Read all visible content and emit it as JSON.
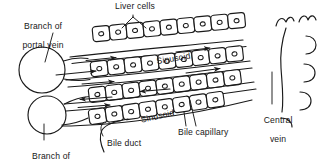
{
  "diagram": {
    "style": {
      "ink": "#1a1a1a",
      "background": "#ffffff",
      "stroke_width": 1.1
    },
    "labels": [
      {
        "id": "liver-cells",
        "text": "Liver cells",
        "lines": [
          "Liver cells"
        ],
        "x": 110,
        "y": 2,
        "align": "center",
        "leader": "two-branch-v"
      },
      {
        "id": "branch-portal-vein",
        "text": "Branch of portal vein",
        "lines": [
          "Branch of",
          "portal vein"
        ],
        "x": 6,
        "y": 12,
        "align": "center",
        "leader": "diagonal-down-right"
      },
      {
        "id": "sinusoid-upper",
        "text": "Sinusoid",
        "lines": [
          "Sinusoid"
        ],
        "x": 156,
        "y": 57,
        "align": "left",
        "rotation": -9,
        "leader": "none"
      },
      {
        "id": "sinusoid-lower",
        "text": "Sinusoid",
        "lines": [
          "Sinusoid"
        ],
        "x": 140,
        "y": 116,
        "align": "left",
        "rotation": -13,
        "leader": "none"
      },
      {
        "id": "central-vein",
        "text": "Central vein",
        "lines": [
          "Central",
          "vein"
        ],
        "x": 272,
        "y": 106,
        "align": "center",
        "leader": "vertical-up"
      },
      {
        "id": "bile-capillary",
        "text": "Bile capillary",
        "lines": [
          "Bile capillary"
        ],
        "x": 178,
        "y": 128,
        "align": "left",
        "leader": "two-vertical-up"
      },
      {
        "id": "bile-duct",
        "text": "Bile duct",
        "lines": [
          "Bile duct"
        ],
        "x": 107,
        "y": 139,
        "align": "left",
        "leader": "curved-up-left"
      },
      {
        "id": "branch-hepatic-artery",
        "text": "Branch of hepatic artery",
        "lines": [
          "Branch of",
          "hepatic artery"
        ],
        "x": 6,
        "y": 142,
        "align": "center",
        "leader": "vertical-up"
      }
    ],
    "structures": [
      {
        "id": "portal-vein-circle",
        "kind": "vessel-lumen",
        "shape": "circle",
        "cx": 42,
        "cy": 70,
        "r": 23
      },
      {
        "id": "hepatic-artery-circle",
        "kind": "vessel-lumen",
        "shape": "circle",
        "cx": 47,
        "cy": 115,
        "r": 19
      },
      {
        "id": "central-vein-outline",
        "kind": "vessel-wall",
        "shape": "scalloped-arc",
        "cx": 296,
        "cy": 72
      },
      {
        "id": "hepatocyte-plate-1",
        "kind": "cell-row",
        "cells": 8
      },
      {
        "id": "hepatocyte-plate-2",
        "kind": "cell-row",
        "cells": 8
      },
      {
        "id": "hepatocyte-plate-3",
        "kind": "cell-row",
        "cells": 8
      },
      {
        "id": "hepatocyte-plate-4",
        "kind": "cell-row",
        "cells": 7
      },
      {
        "id": "sinusoid-channel-1",
        "kind": "sinusoid",
        "flow": "right"
      },
      {
        "id": "sinusoid-channel-2",
        "kind": "sinusoid",
        "flow": "right"
      },
      {
        "id": "sinusoid-channel-3",
        "kind": "sinusoid",
        "flow": "right"
      },
      {
        "id": "bile-duct-tube",
        "kind": "duct",
        "flow": "left"
      }
    ],
    "flow_arrows": [
      {
        "id": "arrow-sinusoid-1a",
        "direction": "right"
      },
      {
        "id": "arrow-sinusoid-1b",
        "direction": "right"
      },
      {
        "id": "arrow-sinusoid-2a",
        "direction": "right"
      },
      {
        "id": "arrow-sinusoid-2b",
        "direction": "right"
      },
      {
        "id": "arrow-sinusoid-3a",
        "direction": "right"
      },
      {
        "id": "arrow-bile-1",
        "direction": "left"
      },
      {
        "id": "arrow-bile-2",
        "direction": "left"
      }
    ]
  }
}
